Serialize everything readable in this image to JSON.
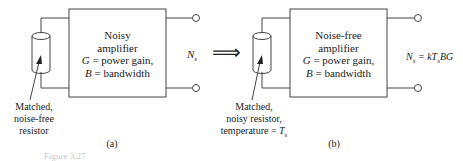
{
  "panel_a": {
    "amplifier": {
      "line1": "Noisy",
      "line2": "amplifier",
      "gain_var": "G",
      "gain_text": " = power gain,",
      "bw_var": "B",
      "bw_text": " = bandwidth"
    },
    "resistor_label": [
      "Matched,",
      "noise-free",
      "resistor"
    ],
    "output_label_var": "N",
    "output_label_sub": "s",
    "panel_label": "(a)"
  },
  "arrow": "⟹",
  "panel_b": {
    "amplifier": {
      "line1": "Noise-free",
      "line2": "amplifier",
      "gain_var": "G",
      "gain_text": " = power gain,",
      "bw_var": "B",
      "bw_text": " = bandwidth"
    },
    "resistor_label": [
      "Matched,",
      "noisy resistor,",
      "temperature = "
    ],
    "resistor_temp_var": "T",
    "resistor_temp_sub": "s",
    "output_label_var": "N",
    "output_label_sub": "s",
    "output_formula": " = kT",
    "output_formula_sub": "s",
    "output_formula_tail": "BG",
    "panel_label": "(b)"
  },
  "caption": "Figure 3.27"
}
